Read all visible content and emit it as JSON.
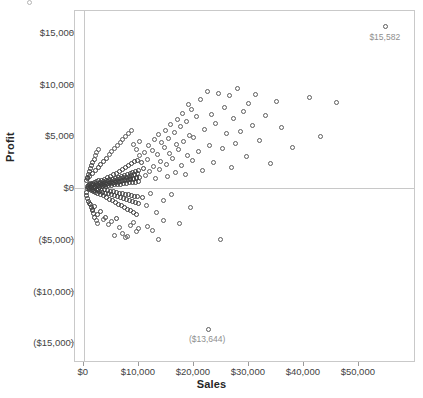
{
  "chart_data": {
    "type": "scatter",
    "title": "",
    "xlabel": "Sales",
    "ylabel": "Profit",
    "xlim": [
      -1600,
      60400
    ],
    "ylim": [
      -16900,
      17100
    ],
    "grid": true,
    "legend": "none",
    "marker": "open-circle",
    "marker_color": "#5d5d5d",
    "xticks": [
      0,
      10000,
      20000,
      30000,
      40000,
      50000
    ],
    "xtick_labels": [
      "$0",
      "$10,000",
      "$20,000",
      "$30,000",
      "$40,000",
      "$50,000"
    ],
    "yticks": [
      15000,
      10000,
      5000,
      0,
      -5000,
      -10000,
      -15000
    ],
    "ytick_labels": [
      "$15,000",
      "$10,000",
      "$5,000",
      "$0",
      "($5,000)",
      "($10,000)",
      "($15,000)"
    ],
    "annotations": [
      {
        "label": "$15,582",
        "x": 54900,
        "y": 15582
      },
      {
        "label": "($13,644)",
        "x": 22600,
        "y": -13644
      }
    ],
    "points": [
      [
        54900,
        15582
      ],
      [
        22600,
        -13644
      ],
      [
        600,
        120
      ],
      [
        750,
        -60
      ],
      [
        820,
        240
      ],
      [
        900,
        40
      ],
      [
        980,
        -180
      ],
      [
        1050,
        310
      ],
      [
        1120,
        -90
      ],
      [
        1190,
        180
      ],
      [
        1250,
        420
      ],
      [
        1310,
        -260
      ],
      [
        1380,
        60
      ],
      [
        1440,
        330
      ],
      [
        1500,
        -140
      ],
      [
        1560,
        210
      ],
      [
        1620,
        480
      ],
      [
        1680,
        -320
      ],
      [
        1740,
        90
      ],
      [
        1800,
        380
      ],
      [
        1860,
        -200
      ],
      [
        1920,
        150
      ],
      [
        1980,
        520
      ],
      [
        2040,
        -420
      ],
      [
        2100,
        70
      ],
      [
        2160,
        290
      ],
      [
        2220,
        -110
      ],
      [
        2280,
        440
      ],
      [
        2340,
        620
      ],
      [
        2400,
        -280
      ],
      [
        2460,
        130
      ],
      [
        2520,
        360
      ],
      [
        2580,
        -520
      ],
      [
        2640,
        200
      ],
      [
        2700,
        680
      ],
      [
        2760,
        -150
      ],
      [
        2820,
        410
      ],
      [
        2880,
        80
      ],
      [
        2940,
        -340
      ],
      [
        3000,
        560
      ],
      [
        3060,
        240
      ],
      [
        3120,
        -600
      ],
      [
        3180,
        330
      ],
      [
        3240,
        720
      ],
      [
        3300,
        -220
      ],
      [
        3360,
        470
      ],
      [
        3420,
        110
      ],
      [
        3480,
        -400
      ],
      [
        3540,
        640
      ],
      [
        3600,
        290
      ],
      [
        3660,
        -760
      ],
      [
        3720,
        380
      ],
      [
        3780,
        850
      ],
      [
        3840,
        -180
      ],
      [
        3900,
        520
      ],
      [
        3960,
        160
      ],
      [
        4020,
        -480
      ],
      [
        4080,
        700
      ],
      [
        4140,
        340
      ],
      [
        4200,
        -900
      ],
      [
        4260,
        430
      ],
      [
        4320,
        980
      ],
      [
        4380,
        -260
      ],
      [
        4440,
        600
      ],
      [
        4500,
        210
      ],
      [
        4560,
        -560
      ],
      [
        4620,
        780
      ],
      [
        4680,
        390
      ],
      [
        4740,
        -1100
      ],
      [
        4800,
        490
      ],
      [
        4860,
        1120
      ],
      [
        4920,
        -300
      ],
      [
        4980,
        670
      ],
      [
        5040,
        260
      ],
      [
        5100,
        -640
      ],
      [
        5160,
        860
      ],
      [
        5220,
        440
      ],
      [
        5280,
        -1250
      ],
      [
        5320,
        540
      ],
      [
        5400,
        1280
      ],
      [
        5460,
        -360
      ],
      [
        5520,
        740
      ],
      [
        5580,
        300
      ],
      [
        5640,
        -720
      ],
      [
        5700,
        940
      ],
      [
        5760,
        500
      ],
      [
        5820,
        -1400
      ],
      [
        5880,
        600
      ],
      [
        5940,
        1440
      ],
      [
        6000,
        -420
      ],
      [
        6060,
        820
      ],
      [
        6120,
        340
      ],
      [
        6180,
        -820
      ],
      [
        6240,
        1040
      ],
      [
        6300,
        560
      ],
      [
        6360,
        -1560
      ],
      [
        6420,
        660
      ],
      [
        6480,
        1620
      ],
      [
        6540,
        -480
      ],
      [
        6600,
        900
      ],
      [
        6660,
        380
      ],
      [
        6720,
        -920
      ],
      [
        6780,
        1140
      ],
      [
        6840,
        620
      ],
      [
        6900,
        -1720
      ],
      [
        6960,
        720
      ],
      [
        7020,
        1800
      ],
      [
        7080,
        -540
      ],
      [
        7140,
        980
      ],
      [
        7200,
        420
      ],
      [
        7260,
        -1020
      ],
      [
        7320,
        1240
      ],
      [
        7380,
        680
      ],
      [
        7440,
        -1880
      ],
      [
        7500,
        780
      ],
      [
        7560,
        1980
      ],
      [
        7620,
        -600
      ],
      [
        7680,
        1060
      ],
      [
        7740,
        460
      ],
      [
        7800,
        -1120
      ],
      [
        7860,
        1340
      ],
      [
        7920,
        740
      ],
      [
        7980,
        -2040
      ],
      [
        8040,
        840
      ],
      [
        8100,
        2160
      ],
      [
        8160,
        -660
      ],
      [
        8220,
        1140
      ],
      [
        8280,
        500
      ],
      [
        8340,
        -1220
      ],
      [
        8400,
        1440
      ],
      [
        8460,
        800
      ],
      [
        8520,
        -2200
      ],
      [
        8580,
        900
      ],
      [
        8640,
        2340
      ],
      [
        8700,
        -720
      ],
      [
        8760,
        1220
      ],
      [
        8820,
        540
      ],
      [
        8880,
        -1320
      ],
      [
        8940,
        1540
      ],
      [
        9000,
        860
      ],
      [
        9060,
        -2360
      ],
      [
        9120,
        960
      ],
      [
        9180,
        2520
      ],
      [
        9240,
        -780
      ],
      [
        9300,
        1300
      ],
      [
        9360,
        580
      ],
      [
        9420,
        -1420
      ],
      [
        9480,
        1640
      ],
      [
        9540,
        920
      ],
      [
        9600,
        -2520
      ],
      [
        9660,
        1020
      ],
      [
        9720,
        2700
      ],
      [
        9780,
        -840
      ],
      [
        9840,
        1380
      ],
      [
        9900,
        620
      ],
      [
        9960,
        -1520
      ],
      [
        10020,
        1740
      ],
      [
        10080,
        980
      ],
      [
        10200,
        3100
      ],
      [
        10400,
        2450
      ],
      [
        10600,
        -900
      ],
      [
        10800,
        1900
      ],
      [
        11000,
        3450
      ],
      [
        11200,
        1250
      ],
      [
        11400,
        -1700
      ],
      [
        11600,
        2800
      ],
      [
        11800,
        4100
      ],
      [
        12000,
        1600
      ],
      [
        12200,
        -480
      ],
      [
        12400,
        3600
      ],
      [
        12600,
        2100
      ],
      [
        12800,
        4700
      ],
      [
        13000,
        900
      ],
      [
        13200,
        -2400
      ],
      [
        13400,
        3200
      ],
      [
        13600,
        5200
      ],
      [
        13800,
        1800
      ],
      [
        14000,
        2600
      ],
      [
        14200,
        4400
      ],
      [
        14400,
        -1200
      ],
      [
        14600,
        3900
      ],
      [
        14800,
        5600
      ],
      [
        15000,
        2300
      ],
      [
        15200,
        1100
      ],
      [
        15400,
        4800
      ],
      [
        15600,
        3300
      ],
      [
        15800,
        6100
      ],
      [
        16000,
        -600
      ],
      [
        16200,
        2900
      ],
      [
        16400,
        5400
      ],
      [
        16600,
        1500
      ],
      [
        16800,
        4200
      ],
      [
        17000,
        6600
      ],
      [
        17200,
        3700
      ],
      [
        17400,
        -3400
      ],
      [
        17600,
        5900
      ],
      [
        17800,
        2200
      ],
      [
        18000,
        7200
      ],
      [
        18200,
        4500
      ],
      [
        18400,
        1300
      ],
      [
        18600,
        6400
      ],
      [
        18800,
        3100
      ],
      [
        19000,
        8100
      ],
      [
        19200,
        5100
      ],
      [
        19400,
        -1900
      ],
      [
        19600,
        7600
      ],
      [
        19800,
        2700
      ],
      [
        20000,
        4900
      ],
      [
        20400,
        6900
      ],
      [
        20800,
        3500
      ],
      [
        21200,
        8600
      ],
      [
        21600,
        1700
      ],
      [
        22000,
        5700
      ],
      [
        22400,
        9300
      ],
      [
        22800,
        4100
      ],
      [
        23200,
        7100
      ],
      [
        23600,
        2500
      ],
      [
        24000,
        6200
      ],
      [
        24400,
        9100
      ],
      [
        24800,
        -5000
      ],
      [
        25200,
        3800
      ],
      [
        25600,
        7800
      ],
      [
        26000,
        5300
      ],
      [
        26400,
        8900
      ],
      [
        26800,
        2000
      ],
      [
        27200,
        6700
      ],
      [
        27600,
        4300
      ],
      [
        28000,
        9600
      ],
      [
        28500,
        5500
      ],
      [
        29000,
        7400
      ],
      [
        29500,
        3000
      ],
      [
        30000,
        8200
      ],
      [
        30600,
        6000
      ],
      [
        31200,
        9000
      ],
      [
        32000,
        4600
      ],
      [
        33000,
        7000
      ],
      [
        34000,
        2400
      ],
      [
        35000,
        8400
      ],
      [
        36000,
        5800
      ],
      [
        38000,
        3900
      ],
      [
        41000,
        8700
      ],
      [
        43000,
        5000
      ],
      [
        46000,
        8300
      ],
      [
        1000,
        -1500
      ],
      [
        1500,
        -2100
      ],
      [
        2000,
        -1800
      ],
      [
        2500,
        -2600
      ],
      [
        3000,
        -2300
      ],
      [
        3500,
        -3000
      ],
      [
        4000,
        -2800
      ],
      [
        4500,
        -3500
      ],
      [
        5000,
        -3200
      ],
      [
        5500,
        -4600
      ],
      [
        6000,
        -2900
      ],
      [
        6500,
        -3800
      ],
      [
        7000,
        -4400
      ],
      [
        7500,
        -4800
      ],
      [
        8000,
        -4700
      ],
      [
        8500,
        -3600
      ],
      [
        9000,
        -3300
      ],
      [
        9500,
        -4200
      ],
      [
        10000,
        -3900
      ],
      [
        11500,
        -3700
      ],
      [
        12500,
        -4100
      ],
      [
        13500,
        -5000
      ],
      [
        14500,
        -3100
      ],
      [
        700,
        900
      ],
      [
        1100,
        1100
      ],
      [
        1600,
        1400
      ],
      [
        2100,
        1700
      ],
      [
        2600,
        2000
      ],
      [
        3100,
        2300
      ],
      [
        3600,
        2600
      ],
      [
        4100,
        2900
      ],
      [
        4600,
        3200
      ],
      [
        5100,
        3500
      ],
      [
        5600,
        3800
      ],
      [
        6100,
        4100
      ],
      [
        6600,
        4400
      ],
      [
        7100,
        4700
      ],
      [
        7600,
        5000
      ],
      [
        8100,
        5300
      ],
      [
        8600,
        5600
      ],
      [
        9100,
        4200
      ],
      [
        9600,
        3700
      ],
      [
        10100,
        4500
      ],
      [
        500,
        -400
      ],
      [
        520,
        700
      ],
      [
        560,
        -700
      ],
      [
        640,
        1000
      ],
      [
        680,
        -1000
      ],
      [
        860,
        1300
      ],
      [
        940,
        -1300
      ],
      [
        1020,
        1600
      ],
      [
        1160,
        -1600
      ],
      [
        1240,
        1900
      ],
      [
        1340,
        -1900
      ],
      [
        1420,
        2200
      ],
      [
        1520,
        -2200
      ],
      [
        1640,
        2500
      ],
      [
        1760,
        -2500
      ],
      [
        1880,
        2800
      ],
      [
        2020,
        -2800
      ],
      [
        2140,
        3100
      ],
      [
        2260,
        -3100
      ],
      [
        2380,
        3400
      ],
      [
        2500,
        -3400
      ],
      [
        2620,
        3700
      ]
    ]
  }
}
